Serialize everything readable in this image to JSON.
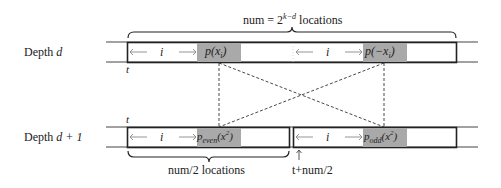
{
  "diagram": {
    "top_brace_label": "num = 2",
    "top_brace_exp": "k−d",
    "top_brace_suffix": " locations",
    "rows": [
      {
        "label_prefix": "Depth ",
        "label_var": "d",
        "pointer_label": "t",
        "segments": [
          {
            "index_label": "i",
            "cell_label": "p(x",
            "cell_sub": "i",
            "cell_suffix": ")"
          },
          {
            "index_label": "i",
            "cell_label": "p(−x",
            "cell_sub": "i",
            "cell_suffix": ")"
          }
        ]
      },
      {
        "label_prefix": "Depth ",
        "label_var": "d + 1",
        "pointer_label": "t",
        "segments": [
          {
            "index_label": "i",
            "cell_label": "p",
            "cell_sub": "even",
            "cell_arg": "(x",
            "cell_arg_sup": "2",
            "cell_arg_sub": "i",
            "cell_suffix": ")"
          },
          {
            "index_label": "i",
            "cell_label": "p",
            "cell_sub": "odd",
            "cell_arg": "(x",
            "cell_arg_sup": "2",
            "cell_arg_sub": "i",
            "cell_suffix": ")"
          }
        ]
      }
    ],
    "bottom_brace_label": "num/2 locations",
    "half_pointer_label": "t+num/2",
    "colors": {
      "highlight": "#a9a9a9",
      "line": "#222222",
      "arrow": "#888888"
    }
  }
}
